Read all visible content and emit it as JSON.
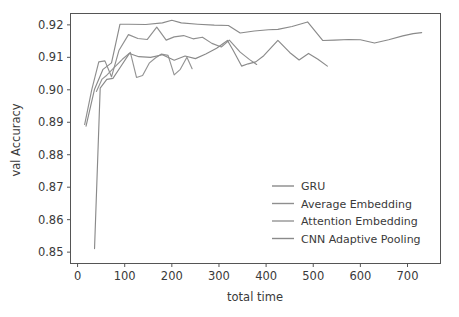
{
  "chart_data": {
    "type": "line",
    "title": "",
    "xlabel": "total time",
    "ylabel": "val Accuracy",
    "xlim": [
      -15,
      770
    ],
    "ylim": [
      0.8465,
      0.9235
    ],
    "xticks": [
      0,
      100,
      200,
      300,
      400,
      500,
      600,
      700
    ],
    "xticklabels": [
      "0",
      "100",
      "200",
      "300",
      "400",
      "500",
      "600",
      "700"
    ],
    "yticks": [
      0.85,
      0.86,
      0.87,
      0.88,
      0.89,
      0.9,
      0.91,
      0.92
    ],
    "yticklabels": [
      "0.85",
      "0.86",
      "0.87",
      "0.88",
      "0.89",
      "0.90",
      "0.91",
      "0.92"
    ],
    "grid": false,
    "legend_position": "center-right",
    "series": [
      {
        "name": "GRU",
        "color": "#8a8a8a",
        "x": [
          18,
          36,
          54,
          72,
          90,
          108,
          145,
          180,
          200,
          220,
          255,
          290,
          320,
          345,
          375,
          405,
          425,
          455,
          488,
          520,
          545,
          575,
          600,
          630,
          660,
          690,
          712,
          730
        ],
        "y": [
          0.8888,
          0.9002,
          0.9063,
          0.9083,
          0.9202,
          0.9202,
          0.9201,
          0.9206,
          0.9214,
          0.9206,
          0.9202,
          0.9199,
          0.9198,
          0.9175,
          0.9181,
          0.9185,
          0.9186,
          0.9195,
          0.9209,
          0.9152,
          0.9153,
          0.9155,
          0.9154,
          0.9144,
          0.9154,
          0.9166,
          0.9173,
          0.9176
        ]
      },
      {
        "name": "Average Embedding",
        "color": "#8f8f8f",
        "x": [
          15,
          30,
          45,
          58,
          72,
          88,
          108,
          128,
          148,
          168,
          188,
          205,
          225,
          245,
          265,
          285,
          305,
          322,
          345,
          365,
          380
        ],
        "y": [
          0.8893,
          0.9,
          0.9086,
          0.9089,
          0.904,
          0.9122,
          0.917,
          0.9158,
          0.9155,
          0.9193,
          0.9153,
          0.9163,
          0.9167,
          0.9157,
          0.9162,
          0.9143,
          0.9132,
          0.9153,
          0.9116,
          0.9093,
          0.9078
        ]
      },
      {
        "name": "Attention Embedding",
        "color": "#949494",
        "x": [
          40,
          52,
          62,
          78,
          95,
          112,
          125,
          138,
          152,
          165,
          178,
          192,
          205,
          218,
          232,
          243
        ],
        "y": [
          0.8995,
          0.9033,
          0.9045,
          0.9069,
          0.9094,
          0.9115,
          0.9038,
          0.9044,
          0.9082,
          0.9098,
          0.911,
          0.9106,
          0.9046,
          0.9063,
          0.91,
          0.9065
        ]
      },
      {
        "name": "CNN Adaptive Pooling",
        "color": "#8a8a8a",
        "x": [
          36,
          48,
          62,
          75,
          90,
          110,
          130,
          155,
          180,
          205,
          228,
          250,
          272,
          295,
          318,
          330,
          348,
          362,
          378,
          395,
          425,
          450,
          470,
          490,
          510,
          530
        ],
        "y": [
          0.8511,
          0.9005,
          0.9032,
          0.9035,
          0.9068,
          0.9112,
          0.9102,
          0.91,
          0.9108,
          0.9091,
          0.9104,
          0.9096,
          0.911,
          0.9128,
          0.9152,
          0.9122,
          0.9073,
          0.908,
          0.9086,
          0.9105,
          0.9152,
          0.9115,
          0.9092,
          0.9112,
          0.9094,
          0.9073
        ]
      }
    ],
    "legend_entries": [
      {
        "label": "GRU",
        "color": "#8a8a8a"
      },
      {
        "label": "Average Embedding",
        "color": "#8f8f8f"
      },
      {
        "label": "Attention Embedding",
        "color": "#949494"
      },
      {
        "label": "CNN Adaptive Pooling",
        "color": "#8a8a8a"
      }
    ]
  }
}
